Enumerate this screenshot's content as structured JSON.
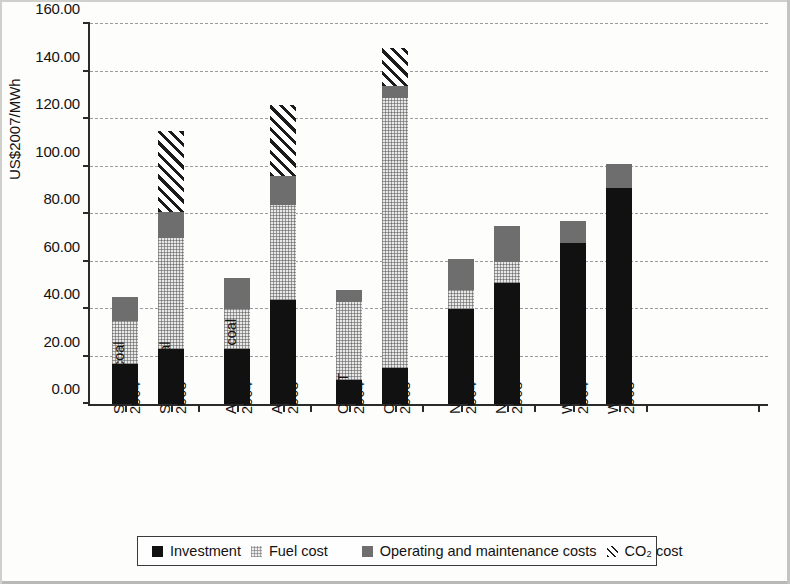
{
  "chart_data": {
    "type": "bar",
    "stacked": true,
    "title": "",
    "xlabel": "",
    "ylabel": "US$2007/MWh",
    "ylim": [
      0,
      160
    ],
    "ytick_step": 20,
    "ytick_labels": [
      "0.00",
      "20.00",
      "40.00",
      "60.00",
      "80.00",
      "100.00",
      "120.00",
      "140.00",
      "160.00"
    ],
    "grid": true,
    "legend_position": "bottom",
    "categories": [
      {
        "line1": "Steam coal",
        "line2": "2004"
      },
      {
        "line1": "Steam coal",
        "line2": "2008"
      },
      {
        "line1": "Advanced coal",
        "line2": "2004"
      },
      {
        "line1": "Advanced coal",
        "line2": "2008"
      },
      {
        "line1": "CCGT",
        "line2": "2004"
      },
      {
        "line1": "CCGT",
        "line2": "2008"
      },
      {
        "line1": "Nuclear",
        "line2": "2004"
      },
      {
        "line1": "Nuclear",
        "line2": "2008"
      },
      {
        "line1": "Wind",
        "line2": "2004"
      },
      {
        "line1": "Wind",
        "line2": "2008"
      }
    ],
    "series": [
      {
        "name": "Investment",
        "key": "investment",
        "color": "#111111",
        "values": [
          17,
          23,
          23,
          44,
          10,
          15,
          40,
          51,
          68,
          91
        ]
      },
      {
        "name": "Fuel cost",
        "key": "fuel",
        "color": "#e8e8e8",
        "values": [
          18,
          47,
          17,
          40,
          33,
          114,
          8,
          9,
          0,
          0
        ]
      },
      {
        "name": "Operating and maintenance costs",
        "key": "om",
        "color": "#6e6e6e",
        "values": [
          10,
          11,
          13,
          12,
          5,
          5,
          13,
          15,
          9,
          10
        ]
      },
      {
        "name": "CO2 cost",
        "key": "co2",
        "color": "#1b1b1b",
        "values": [
          0,
          34,
          0,
          30,
          0,
          16,
          0,
          0,
          0,
          0
        ]
      }
    ],
    "totals": [
      45,
      115,
      53,
      126,
      48,
      150,
      61,
      75,
      77,
      101
    ]
  },
  "legend": {
    "items": [
      {
        "label": "Investment",
        "swatch": "investment"
      },
      {
        "label": "Fuel cost",
        "swatch": "fuel"
      },
      {
        "label": "Operating and maintenance costs",
        "swatch": "om"
      },
      {
        "label": "CO₂ cost",
        "swatch": "co2"
      }
    ]
  }
}
